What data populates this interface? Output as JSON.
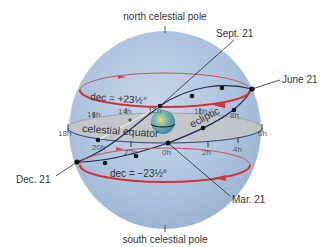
{
  "labels": {
    "north_pole": "north celestial pole",
    "south_pole": "south celestial pole",
    "sept21": "Sept. 21",
    "june21": "June 21",
    "dec21": "Dec. 21",
    "mar21": "Mar. 21",
    "equator": "celestial equator",
    "ecliptic": "ecliptic",
    "dec_upper": "dec = +23½°",
    "dec_lower": "dec = −23½°"
  },
  "hours": {
    "h18": "18h",
    "h16": "16h",
    "h14": "14h",
    "h12": "12h",
    "h10": "10h",
    "h8": "8h",
    "h6": "6h",
    "h4": "4h",
    "h2": "2h",
    "h0": "0h",
    "h22": "22h",
    "h20": "20h"
  },
  "colors": {
    "sphere": "#a9c0dc",
    "equator_plane": "#c4c6c4",
    "dec_circle": "#d0343a",
    "ecliptic": "#1d2b57",
    "leader": "#222222"
  }
}
